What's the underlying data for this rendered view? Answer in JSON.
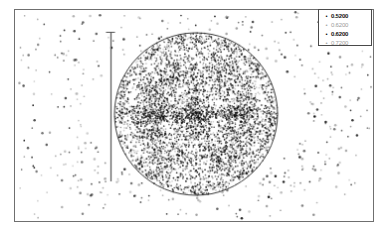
{
  "figure": {
    "background": "#ffffff",
    "frame_color": "#6f6f6f"
  },
  "legend": {
    "position": "top-right",
    "border_color": "#4a4a4a",
    "entries": [
      {
        "marker": "•",
        "label": "0.5200",
        "emphasis": "strong",
        "color": "#111111"
      },
      {
        "marker": "•",
        "label": "0.6200",
        "emphasis": "faint",
        "color": "#9a9a9a"
      },
      {
        "marker": "•",
        "label": "0.6200",
        "emphasis": "strong",
        "color": "#111111"
      },
      {
        "marker": "•",
        "label": "0.7200",
        "emphasis": "faint",
        "color": "#9a9a9a"
      }
    ]
  },
  "chart_data": {
    "type": "scatter",
    "title": "",
    "xlabel": "",
    "ylabel": "",
    "grid": false,
    "legend_position": "upper right",
    "xlim": [
      0,
      360
    ],
    "ylim": [
      0,
      213
    ],
    "axis_ticks_visible": false,
    "annotations": [
      {
        "kind": "circle-outline",
        "center_x": 182,
        "center_y": 105,
        "radius": 82,
        "stroke": "#3a3a3a",
        "fill": "none"
      },
      {
        "kind": "vertical-errorbar",
        "x": 96,
        "y_top": 22,
        "y_bottom": 173,
        "cap_width": 9,
        "stroke": "#555555"
      }
    ],
    "series": [
      {
        "name": "0.5200",
        "marker": "circle",
        "color": "#111111",
        "description": "dense symmetric core cluster inside circle",
        "point_count": 2400
      },
      {
        "name": "0.6200",
        "marker": "circle",
        "color": "#9a9a9a",
        "description": "mid-density grey halo within circle",
        "point_count": 1600
      },
      {
        "name": "0.6200",
        "marker": "circle",
        "color": "#111111",
        "description": "inner mirrored fractal lobes",
        "point_count": 1200
      },
      {
        "name": "0.7200",
        "marker": "circle",
        "color": "#9a9a9a",
        "description": "sparse outliers scattered beyond circle",
        "point_count": 420
      }
    ]
  }
}
